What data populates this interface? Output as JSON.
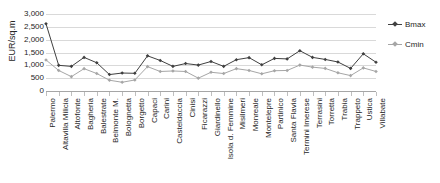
{
  "chart_data": {
    "type": "line",
    "title": "",
    "xlabel": "",
    "ylabel": "EUR/sq.m",
    "ylim": [
      0,
      3000
    ],
    "ytick_values": [
      0,
      500,
      1000,
      1500,
      2000,
      2500,
      3000
    ],
    "ytick_labels": [
      "0",
      "500",
      "1,000",
      "1,500",
      "2,000",
      "2,500",
      "3,000"
    ],
    "grid": true,
    "legend_position": "right",
    "categories": [
      "Palermo",
      "Altavilla Milicia",
      "Altofonte",
      "Bagheria",
      "Balestrate",
      "Belmonte M.",
      "Bolognetta",
      "Borgetto",
      "Capaci",
      "Carini",
      "Casteldaccia",
      "Cinisi",
      "Ficarazzi",
      "Giardinello",
      "Isola d. Femmine",
      "Misilmeri",
      "Monreale",
      "Montelepre",
      "Partinico",
      "Santa Flavia",
      "Termini Imerese",
      "Terrasini",
      "Torretta",
      "Trabia",
      "Trappeto",
      "Ustica",
      "Villabate"
    ],
    "series": [
      {
        "name": "Bmax",
        "color": "#404040",
        "values": [
          2620,
          1000,
          960,
          1310,
          1100,
          640,
          700,
          690,
          1370,
          1190,
          960,
          1070,
          1010,
          1150,
          960,
          1220,
          1300,
          1020,
          1270,
          1250,
          1570,
          1310,
          1230,
          1130,
          880,
          1450,
          1120
        ]
      },
      {
        "name": "Cmin",
        "color": "#a6a6a6",
        "values": [
          1210,
          800,
          560,
          870,
          680,
          420,
          340,
          430,
          950,
          760,
          780,
          760,
          500,
          730,
          680,
          870,
          800,
          670,
          790,
          800,
          1010,
          930,
          880,
          710,
          600,
          900,
          760
        ]
      }
    ]
  },
  "legend": {
    "entries": [
      {
        "label": "Bmax"
      },
      {
        "label": "Cmin"
      }
    ]
  }
}
